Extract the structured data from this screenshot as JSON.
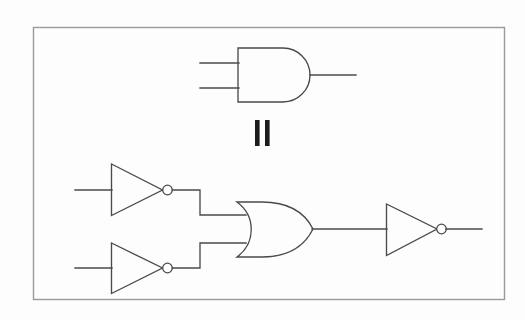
{
  "figure": {
    "background_color": "#fdfdfd",
    "line_color": "#4a4a4a",
    "frame_color": "#9a9a9a",
    "equals_color": "#1c1c1c",
    "frame": {
      "x": 33,
      "y": 27,
      "width": 472,
      "height": 273
    }
  },
  "relation": {
    "symbol_name": "equals-sign-rotated",
    "symbol_text": "=",
    "bars": [
      {
        "x": 255,
        "y": 120,
        "width": 5,
        "height": 26
      },
      {
        "x": 265,
        "y": 120,
        "width": 5,
        "height": 26
      }
    ]
  },
  "top_circuit": {
    "label": "AND gate expression",
    "gates": [
      {
        "name": "and-gate",
        "type": "AND",
        "body": {
          "left": 238,
          "top": 48,
          "right": 312,
          "bottom": 102
        },
        "inputs": [
          {
            "name": "and-input-a",
            "x1": 200,
            "y": 63,
            "x2": 238
          },
          {
            "name": "and-input-b",
            "x1": 200,
            "y": 88,
            "x2": 238
          }
        ],
        "output": {
          "name": "and-output",
          "x1": 312,
          "y": 75,
          "x2": 356
        }
      }
    ]
  },
  "bottom_circuit": {
    "label": "Equivalent NOR-of-inverters expression",
    "gates": [
      {
        "name": "not-gate-top",
        "type": "NOT",
        "triangle": {
          "left": 111,
          "top": 164,
          "right": 162,
          "bottom": 215,
          "center_y": 190
        },
        "bubble": {
          "cx": 167.5,
          "cy": 190,
          "r": 5
        },
        "input": {
          "name": "not-top-input",
          "x1": 75,
          "y": 190,
          "x2": 111
        }
      },
      {
        "name": "not-gate-bottom",
        "type": "NOT",
        "triangle": {
          "left": 111,
          "top": 243,
          "right": 162,
          "bottom": 293,
          "center_y": 268
        },
        "bubble": {
          "cx": 167.5,
          "cy": 268,
          "r": 5
        },
        "input": {
          "name": "not-bottom-input",
          "x1": 75,
          "y": 268,
          "x2": 111
        }
      },
      {
        "name": "or-gate",
        "type": "OR",
        "body": {
          "left": 237,
          "top": 202,
          "right": 313,
          "bottom": 257,
          "center_y": 229
        },
        "inputs": [
          {
            "name": "or-input-a",
            "y": 215
          },
          {
            "name": "or-input-b",
            "y": 243
          }
        ],
        "output": {
          "name": "or-output",
          "x1": 313,
          "y": 229,
          "x2": 386
        }
      },
      {
        "name": "not-gate-output",
        "type": "NOT",
        "triangle": {
          "left": 386,
          "top": 204,
          "right": 437,
          "bottom": 255,
          "center_y": 229
        },
        "bubble": {
          "cx": 441.5,
          "cy": 229,
          "r": 5
        },
        "output": {
          "name": "final-output",
          "x1": 446,
          "y": 229,
          "x2": 482
        }
      }
    ],
    "wires": [
      {
        "name": "wire-top-not-to-or",
        "points": "172.5,190 200,190 200,215 245,215"
      },
      {
        "name": "wire-bottom-not-to-or",
        "points": "172.5,268 200,268 200,243 245,243"
      }
    ]
  }
}
